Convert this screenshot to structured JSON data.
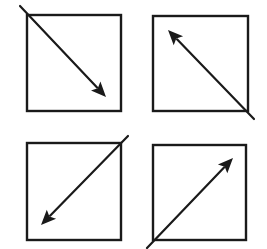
{
  "canvas": {
    "width": 267,
    "height": 249,
    "background": "#ffffff",
    "stroke_color": "#1a1a1a"
  },
  "panels": [
    {
      "id": "top-left",
      "direction": "down-right",
      "box": {
        "x": 27,
        "y": 15,
        "w": 94,
        "h": 96
      },
      "arrow": {
        "x1": 20,
        "y1": 6,
        "x2": 106,
        "y2": 97
      }
    },
    {
      "id": "top-right",
      "direction": "up-left",
      "box": {
        "x": 153,
        "y": 16,
        "w": 95,
        "h": 95
      },
      "arrow": {
        "x1": 254,
        "y1": 119,
        "x2": 168,
        "y2": 30
      }
    },
    {
      "id": "bottom-left",
      "direction": "down-left",
      "box": {
        "x": 27,
        "y": 143,
        "w": 94,
        "h": 97
      },
      "arrow": {
        "x1": 128,
        "y1": 136,
        "x2": 41,
        "y2": 225
      }
    },
    {
      "id": "bottom-right",
      "direction": "up-right",
      "box": {
        "x": 153,
        "y": 145,
        "w": 93,
        "h": 95
      },
      "arrow": {
        "x1": 147,
        "y1": 248,
        "x2": 233,
        "y2": 158
      }
    }
  ]
}
